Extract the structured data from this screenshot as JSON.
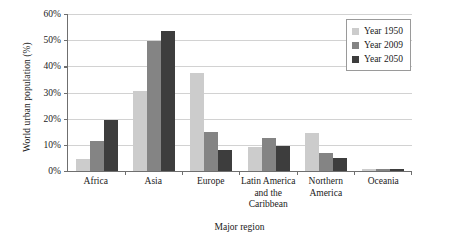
{
  "chart_data": {
    "type": "bar",
    "title": "",
    "xlabel": "Major region",
    "ylabel": "World urban population (%)",
    "categories": [
      "Africa",
      "Asia",
      "Europe",
      "Latin America and the Caribbean",
      "Northern America",
      "Oceania"
    ],
    "series": [
      {
        "name": "Year 1950",
        "color": "#cccccc",
        "values": [
          4.5,
          30.5,
          37.5,
          9.0,
          14.5,
          0.7
        ]
      },
      {
        "name": "Year 2009",
        "color": "#848484",
        "values": [
          11.5,
          49.5,
          15.0,
          12.5,
          7.0,
          0.6
        ]
      },
      {
        "name": "Year 2050",
        "color": "#3d3d3d",
        "values": [
          19.5,
          53.5,
          8.0,
          9.5,
          5.0,
          0.6
        ]
      }
    ],
    "ylim": [
      0,
      60
    ],
    "yticks": [
      0,
      10,
      20,
      30,
      40,
      50,
      60
    ],
    "ytick_labels": [
      "0%",
      "10%",
      "20%",
      "30%",
      "40%",
      "50%",
      "60%"
    ],
    "grid": true,
    "legend_position": "top-right"
  }
}
